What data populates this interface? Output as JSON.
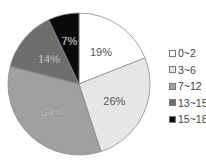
{
  "chart_data": {
    "type": "pie",
    "title": "",
    "categories": [
      "0~2",
      "3~6",
      "7~12",
      "13~15",
      "15~18"
    ],
    "values": [
      19,
      26,
      34,
      14,
      7
    ],
    "labels": [
      "19%",
      "26%",
      "34%",
      "14%",
      "7%"
    ],
    "colors": [
      "#ffffff",
      "#e6e6e6",
      "#a0a0a0",
      "#6e6e6e",
      "#0a0a0a"
    ],
    "label_colors": [
      "#555555",
      "#555555",
      "#ffffff",
      "#ffffff",
      "#ffffff"
    ],
    "start_angle_deg": 0,
    "direction": "clockwise",
    "legend_position": "right"
  },
  "legend": {
    "items": [
      {
        "label": "0~2",
        "color": "#ffffff"
      },
      {
        "label": "3~6",
        "color": "#e6e6e6"
      },
      {
        "label": "7~12",
        "color": "#a0a0a0"
      },
      {
        "label": "13~15",
        "color": "#6e6e6e"
      },
      {
        "label": "15~18",
        "color": "#0a0a0a"
      }
    ]
  }
}
